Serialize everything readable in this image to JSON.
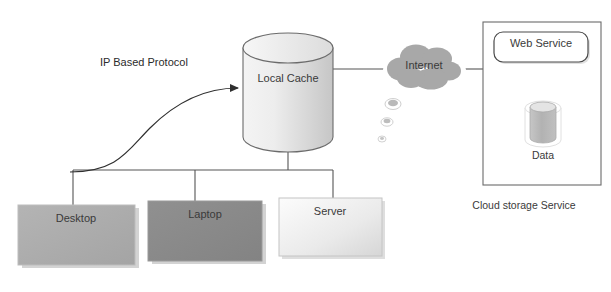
{
  "diagram": {
    "title_label": "IP Based Protocol",
    "nodes": {
      "local_cache": "Local Cache",
      "internet": "Internet",
      "web_service": "Web Service",
      "data": "Data",
      "desktop": "Desktop",
      "laptop": "Laptop",
      "server": "Server"
    },
    "captions": {
      "cloud_storage_service": "Cloud storage Service"
    },
    "colors": {
      "cylinder_light": "#f2f2f2",
      "cylinder_dark": "#c9c9c9",
      "cloud_fill": "#a8a8a8",
      "desktop_fill": "#adadad",
      "laptop_fill": "#8a8a8a",
      "server_fill_light": "#fbfbfb",
      "server_fill_dark": "#d8d8d8",
      "line_stroke": "#555555",
      "box_stroke": "#6b6b6b",
      "text": "#3a3a3a",
      "shadow": "#d0d0d0",
      "data_body": "#b6b6b6"
    }
  }
}
